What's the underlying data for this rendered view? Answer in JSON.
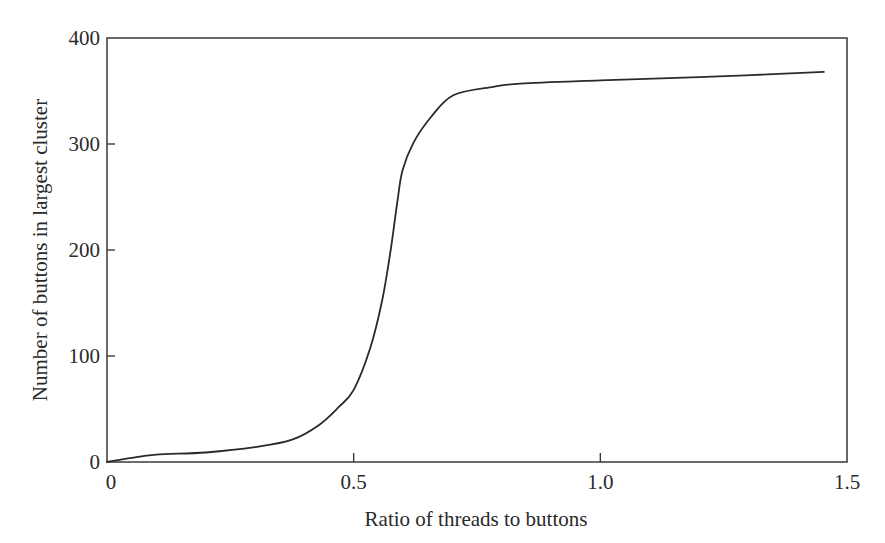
{
  "chart_data": {
    "type": "line",
    "title": "",
    "xlabel": "Ratio of threads to buttons",
    "ylabel": "Number of buttons in largest cluster",
    "xlim": [
      0,
      1.5
    ],
    "ylim": [
      0,
      400
    ],
    "x_ticks": [
      0,
      0.5,
      1.0,
      1.5
    ],
    "x_tick_labels": [
      "0",
      "0.5",
      "1.0",
      "1.5"
    ],
    "y_ticks": [
      0,
      100,
      200,
      300,
      400
    ],
    "y_tick_labels": [
      "0",
      "100",
      "200",
      "300",
      "400"
    ],
    "grid": false,
    "legend": null,
    "series": [
      {
        "name": "largest cluster size",
        "color": "#2a2a2a",
        "x": [
          0,
          0.05,
          0.1,
          0.2,
          0.3,
          0.375,
          0.43,
          0.47,
          0.5,
          0.534,
          0.558,
          0.575,
          0.589,
          0.599,
          0.621,
          0.656,
          0.702,
          0.783,
          0.838,
          1.0,
          1.2,
          1.453
        ],
        "y": [
          0,
          4,
          7,
          9,
          14,
          21,
          35,
          52,
          68,
          108,
          153,
          200,
          247,
          275,
          301,
          325,
          346,
          354,
          357,
          360,
          363,
          368
        ]
      }
    ]
  },
  "axes": {
    "x_title": "Ratio of threads to buttons",
    "y_title": "Number of buttons in largest cluster",
    "x_tick_labels": [
      "0",
      "0.5",
      "1.0",
      "1.5"
    ],
    "y_tick_labels": [
      "0",
      "100",
      "200",
      "300",
      "400"
    ]
  }
}
